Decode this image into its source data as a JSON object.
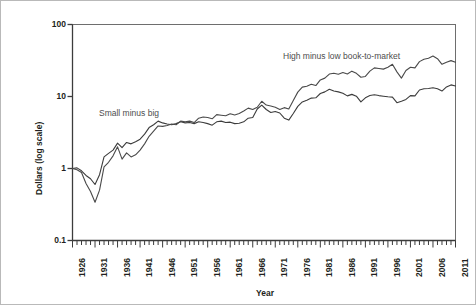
{
  "figure": {
    "yaxis_title": "Dollars (log scale)",
    "xaxis_title": "Year"
  },
  "annotations": {
    "smb": "Small minus big",
    "hml": "High minus low book-to-market"
  },
  "chart_data": {
    "type": "line",
    "title": "",
    "xlabel": "Year",
    "ylabel": "Dollars (log scale)",
    "yscale": "log",
    "ylim": [
      0.1,
      100
    ],
    "ytick_labels": [
      "100",
      "10",
      "1",
      "0.1"
    ],
    "ytick_values": [
      100,
      10,
      1,
      0.1
    ],
    "xlim": [
      1926,
      2011
    ],
    "xtick_labels": [
      "1926",
      "1931",
      "1936",
      "1941",
      "1946",
      "1951",
      "1956",
      "1961",
      "1966",
      "1971",
      "1976",
      "1981",
      "1986",
      "1991",
      "1996",
      "2001",
      "2006",
      "2011"
    ],
    "xtick_values": [
      1926,
      1931,
      1936,
      1941,
      1946,
      1951,
      1956,
      1961,
      1966,
      1971,
      1976,
      1981,
      1986,
      1991,
      1996,
      2001,
      2006,
      2011
    ],
    "minor_xticks": "every year",
    "grid": false,
    "legend_position": "inline-annotations",
    "x": [
      1926,
      1927,
      1928,
      1929,
      1930,
      1931,
      1932,
      1933,
      1934,
      1935,
      1936,
      1937,
      1938,
      1939,
      1940,
      1941,
      1942,
      1943,
      1944,
      1945,
      1946,
      1947,
      1948,
      1949,
      1950,
      1951,
      1952,
      1953,
      1954,
      1955,
      1956,
      1957,
      1958,
      1959,
      1960,
      1961,
      1962,
      1963,
      1964,
      1965,
      1966,
      1967,
      1968,
      1969,
      1970,
      1971,
      1972,
      1973,
      1974,
      1975,
      1976,
      1977,
      1978,
      1979,
      1980,
      1981,
      1982,
      1983,
      1984,
      1985,
      1986,
      1987,
      1988,
      1989,
      1990,
      1991,
      1992,
      1993,
      1994,
      1995,
      1996,
      1997,
      1998,
      1999,
      2000,
      2001,
      2002,
      2003,
      2004,
      2005,
      2006,
      2007,
      2008,
      2009,
      2010,
      2011
    ],
    "series": [
      {
        "name": "Small minus big",
        "color": "#3c3c3c",
        "values": [
          1.0,
          1.02,
          0.93,
          0.8,
          0.72,
          0.6,
          0.82,
          1.45,
          1.62,
          1.8,
          2.25,
          1.95,
          2.3,
          2.2,
          2.35,
          2.55,
          3.0,
          3.7,
          4.05,
          4.55,
          4.3,
          4.15,
          4.05,
          4.2,
          4.45,
          4.3,
          4.35,
          4.2,
          4.45,
          4.35,
          4.2,
          4.0,
          4.45,
          4.55,
          4.35,
          4.4,
          4.2,
          4.25,
          4.45,
          5.0,
          5.1,
          6.7,
          7.6,
          6.6,
          6.0,
          6.2,
          5.9,
          5.0,
          4.7,
          5.8,
          7.3,
          8.4,
          8.9,
          9.5,
          9.6,
          11.0,
          11.6,
          12.6,
          11.9,
          11.6,
          11.1,
          10.2,
          10.7,
          10.1,
          8.4,
          9.6,
          10.3,
          10.6,
          10.3,
          10.1,
          9.9,
          9.8,
          8.2,
          8.6,
          9.1,
          10.3,
          10.2,
          12.3,
          12.8,
          12.9,
          13.2,
          12.8,
          11.9,
          13.6,
          14.5,
          14.0
        ]
      },
      {
        "name": "High minus low book-to-market",
        "color": "#4a4a4a",
        "values": [
          1.0,
          0.96,
          0.88,
          0.62,
          0.48,
          0.34,
          0.5,
          1.05,
          1.22,
          1.5,
          2.0,
          1.35,
          1.65,
          1.45,
          1.55,
          1.8,
          2.2,
          2.8,
          3.3,
          3.9,
          3.85,
          3.95,
          4.15,
          4.05,
          4.55,
          4.45,
          4.55,
          4.35,
          5.0,
          5.2,
          5.1,
          4.9,
          5.6,
          5.5,
          5.4,
          5.75,
          5.55,
          5.8,
          6.3,
          6.9,
          6.6,
          7.1,
          8.6,
          7.6,
          7.4,
          7.1,
          6.6,
          7.0,
          6.7,
          8.8,
          11.5,
          13.5,
          13.9,
          14.8,
          14.2,
          17.0,
          18.0,
          20.5,
          21.0,
          20.4,
          21.5,
          20.5,
          22.5,
          21.0,
          18.5,
          19.0,
          22.5,
          25.0,
          24.5,
          24.0,
          25.5,
          28.0,
          22.0,
          18.0,
          23.0,
          25.5,
          25.0,
          30.5,
          33.0,
          34.0,
          36.5,
          33.5,
          28.0,
          30.0,
          31.5,
          30.0
        ]
      }
    ]
  }
}
